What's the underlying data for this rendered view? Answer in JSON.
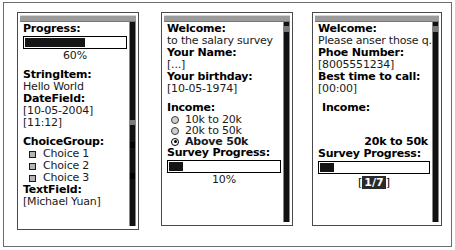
{
  "devices": [
    {
      "name": "midp-form-widgets",
      "progress": {
        "label": "Progress:",
        "percent_text": "60%",
        "percent": 60
      },
      "string_item": {
        "label": "StringItem:",
        "value": "Hello World"
      },
      "date_field": {
        "label": "DateField:",
        "date_value": "[10-05-2004]",
        "time_value": "[11:12]"
      },
      "choice_group": {
        "label": "ChoiceGroup:",
        "choices": [
          {
            "text": "Choice 1",
            "checked": false
          },
          {
            "text": "Choice 2",
            "checked": false
          },
          {
            "text": "Choice 3",
            "checked": false
          }
        ]
      },
      "text_field": {
        "label": "TextField:",
        "value": "[Michael Yuan]"
      }
    },
    {
      "name": "salary-survey-page-1",
      "welcome": {
        "label": "Welcome:",
        "value": "to the salary survey"
      },
      "name_field": {
        "label": "Your Name:",
        "value": "[...]"
      },
      "birthday_field": {
        "label": "Your birthday:",
        "value": "[10-05-1974]"
      },
      "income": {
        "label": "Income:",
        "options": [
          {
            "text": "10k to 20k",
            "selected": false
          },
          {
            "text": "20k to 50k",
            "selected": false
          },
          {
            "text": "Above 50k",
            "selected": true
          }
        ]
      },
      "survey_progress": {
        "label": "Survey Progress:",
        "percent_text": "10%",
        "percent": 10
      }
    },
    {
      "name": "salary-survey-page-2",
      "welcome": {
        "label": "Welcome:",
        "value": "Please anser those q..."
      },
      "phone_field": {
        "label": "Phoe Number:",
        "value": "[8005551234]"
      },
      "best_time_field": {
        "label": "Best time to call:",
        "value": "[00:00]"
      },
      "income": {
        "label": "Income:",
        "selected_value": "20k to 50k"
      },
      "survey_progress": {
        "label": "Survey Progress:",
        "percent": 13
      },
      "pager": {
        "open_bracket": "[",
        "page_text": "1/7",
        "close_bracket": "]"
      }
    }
  ],
  "colors": {
    "frame": "#6b6b6b",
    "device_border": "#4a4a4a",
    "titlebar": "#9b9b9b",
    "gauge_fill": "#151515",
    "scrollbar": "#111111",
    "checkbox_fill": "#b4b4b4",
    "text": "#000000"
  }
}
